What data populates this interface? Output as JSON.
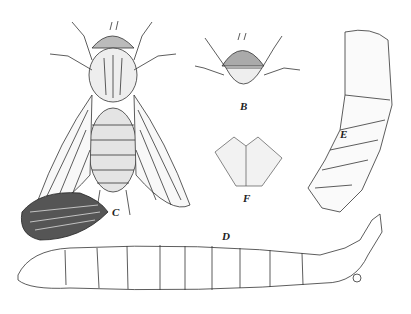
{
  "figure": {
    "panels": [
      {
        "label": "A",
        "subject": "adult fly, dorsal view, wings spread"
      },
      {
        "label": "B",
        "subject": "head and thorax, front view"
      },
      {
        "label": "C",
        "subject": "egg mass"
      },
      {
        "label": "D",
        "subject": "larva"
      },
      {
        "label": "E",
        "subject": "pupa"
      },
      {
        "label": "F",
        "subject": "plate / mouthpart detail"
      }
    ],
    "colors": {
      "ink": "#333333",
      "background": "#ffffff"
    }
  }
}
